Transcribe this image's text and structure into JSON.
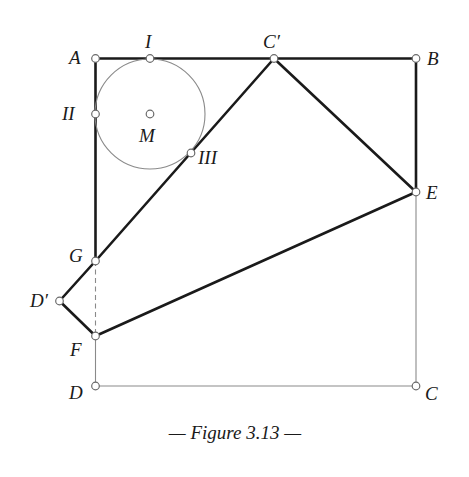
{
  "figure": {
    "caption": "— Figure 3.13 —",
    "points": [
      {
        "id": "A",
        "label": "A"
      },
      {
        "id": "B",
        "label": "B"
      },
      {
        "id": "C",
        "label": "C"
      },
      {
        "id": "D",
        "label": "D"
      },
      {
        "id": "Cp",
        "label": "C′"
      },
      {
        "id": "Dp",
        "label": "D′"
      },
      {
        "id": "E",
        "label": "E"
      },
      {
        "id": "F",
        "label": "F"
      },
      {
        "id": "G",
        "label": "G"
      },
      {
        "id": "M",
        "label": "M"
      },
      {
        "id": "I",
        "label": "I"
      },
      {
        "id": "II",
        "label": "II"
      },
      {
        "id": "III",
        "label": "III"
      }
    ],
    "segments": {
      "thick": [
        [
          "A",
          "Cp"
        ],
        [
          "Cp",
          "B"
        ],
        [
          "B",
          "E"
        ],
        [
          "A",
          "G"
        ],
        [
          "G",
          "Cp"
        ],
        [
          "Cp",
          "E"
        ],
        [
          "E",
          "F"
        ],
        [
          "F",
          "Dp"
        ],
        [
          "Dp",
          "G"
        ]
      ],
      "thin": [
        [
          "E",
          "C"
        ],
        [
          "C",
          "D"
        ],
        [
          "D",
          "F"
        ]
      ],
      "dashed": [
        [
          "G",
          "F"
        ]
      ]
    },
    "circle": {
      "center": "M",
      "tangent_points": [
        "I",
        "II",
        "III"
      ]
    }
  }
}
